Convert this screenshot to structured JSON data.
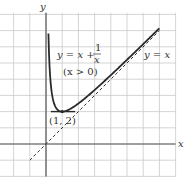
{
  "chart_data": {
    "type": "line",
    "title": "",
    "xlabel": "x",
    "ylabel": "y",
    "xlim": [
      -2,
      8
    ],
    "ylim": [
      -2,
      8
    ],
    "grid": true,
    "series": [
      {
        "name": "y = x + 1/x",
        "style": "solid",
        "domain": "x > 0",
        "x": [
          0.15,
          0.2,
          0.25,
          0.33,
          0.5,
          0.75,
          1,
          1.5,
          2,
          3,
          4,
          5,
          6,
          7
        ],
        "values": [
          6.82,
          5.2,
          4.25,
          3.36,
          2.5,
          2.08,
          2,
          2.17,
          2.5,
          3.33,
          4.25,
          5.2,
          6.17,
          7.14
        ]
      },
      {
        "name": "y = x",
        "style": "dashed",
        "x": [
          -1,
          7
        ],
        "values": [
          -1,
          7
        ]
      },
      {
        "name": "tangent y = 2",
        "style": "solid",
        "x": [
          0.3,
          1.8
        ],
        "values": [
          2,
          2
        ]
      }
    ],
    "annotations": [
      {
        "text_main": "y = x + ",
        "frac_num": "1",
        "frac_den": "x",
        "position": "upper-left of curve"
      },
      {
        "text": "(x > 0)",
        "position": "below formula"
      },
      {
        "text": "y = x",
        "position": "right of asymptote"
      },
      {
        "text": "(1, 2)",
        "position": "below minimum point"
      }
    ],
    "points": [
      {
        "x": 1,
        "y": 2,
        "label": "(1, 2)"
      }
    ]
  },
  "labels": {
    "x_axis": "x",
    "y_axis": "y",
    "formula_main": "y = x + ",
    "formula_num": "1",
    "formula_den": "x",
    "domain_note": "(x > 0)",
    "asymptote": "y = x",
    "min_point": "(1, 2)"
  }
}
